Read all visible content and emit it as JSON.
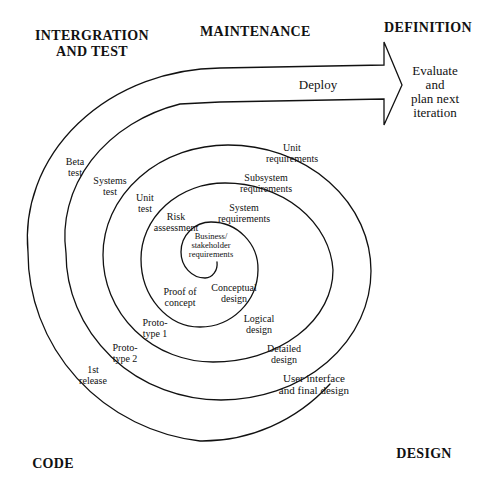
{
  "phases": {
    "integration_test": [
      "INTERGRATION",
      "AND TEST"
    ],
    "maintenance": "MAINTENANCE",
    "definition": "DEFINITION",
    "code": "CODE",
    "design": "DESIGN"
  },
  "arrow": {
    "label": "Deploy",
    "tip_text": [
      "Evaluate",
      "and",
      "plan next",
      "iteration"
    ]
  },
  "spiral_labels": {
    "business_req": [
      "Business/",
      "stakeholder",
      "requirements"
    ],
    "conceptual_design": [
      "Conceptual",
      "design"
    ],
    "proof_of_concept": [
      "Proof of",
      "concept"
    ],
    "risk_assessment": [
      "Risk",
      "assessment"
    ],
    "system_req": [
      "System",
      "requirements"
    ],
    "logical_design": [
      "Logical",
      "design"
    ],
    "prototype_1": [
      "Proto-",
      "type 1"
    ],
    "unit_test": [
      "Unit",
      "test"
    ],
    "subsystem_req": [
      "Subsystem",
      "requirements"
    ],
    "detailed_design": [
      "Detailed",
      "design"
    ],
    "prototype_2": [
      "Proto-",
      "type 2"
    ],
    "systems_test": [
      "Systems",
      "test"
    ],
    "unit_req": [
      "Unit",
      "requirements"
    ],
    "ui_final_design": [
      "User interface",
      "and final design"
    ],
    "first_release": [
      "1st",
      "release"
    ],
    "beta_test": [
      "Beta",
      "test"
    ]
  },
  "colors": {
    "line": "#111111",
    "background": "#ffffff"
  }
}
